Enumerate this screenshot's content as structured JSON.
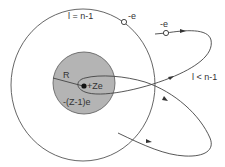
{
  "diagram": {
    "labels": {
      "outer_orbit": "l = n-1",
      "penetrating_orbit": "l < n-1",
      "electron_outer": "-e",
      "electron_penetrating": "-e",
      "core_radius": "R",
      "nucleus_charge": "+Ze",
      "core_charge": "-(Z-1)e"
    },
    "colors": {
      "line": "#555555",
      "core_fill": "#b4b4b4",
      "core_stroke": "#666666",
      "nucleus": "#111111",
      "background": "#ffffff"
    }
  }
}
